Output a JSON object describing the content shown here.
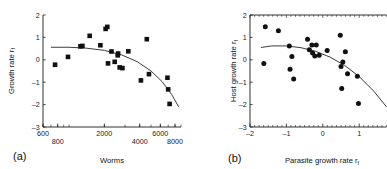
{
  "figure": {
    "background": "#ffffff",
    "ink_color": "#111111",
    "curve_color": "#3c3c3c",
    "marker_color": "#101010"
  },
  "chart_data": [
    {
      "type": "scatter",
      "panel_label": "(a)",
      "title": "",
      "xlabel": "Worms",
      "ylabel": "Growth rate r",
      "ylabel_subscript": "f",
      "xscale": "log",
      "xlim": [
        600,
        9000
      ],
      "ylim": [
        -3,
        2
      ],
      "xticks": [
        600,
        800,
        2000,
        4000,
        6000,
        8000
      ],
      "xtick_labels": [
        "600",
        "800",
        "2000",
        "4000",
        "6000",
        "8000"
      ],
      "xtick_rows": [
        0,
        1,
        0,
        1,
        0,
        1
      ],
      "yticks": [
        -3,
        -2,
        -1,
        0,
        1,
        2
      ],
      "ytick_labels": [
        "-3",
        "-2",
        "-1",
        "0",
        "1",
        "2"
      ],
      "grid": false,
      "legend": "none",
      "marker": "square",
      "points": [
        {
          "x": 760,
          "y": -0.22
        },
        {
          "x": 980,
          "y": 0.13
        },
        {
          "x": 1250,
          "y": 0.6
        },
        {
          "x": 1300,
          "y": 0.62
        },
        {
          "x": 1500,
          "y": 1.07
        },
        {
          "x": 1850,
          "y": 0.65
        },
        {
          "x": 2050,
          "y": 1.38
        },
        {
          "x": 2120,
          "y": 1.47
        },
        {
          "x": 2150,
          "y": -0.16
        },
        {
          "x": 2300,
          "y": 0.37
        },
        {
          "x": 2450,
          "y": -0.09
        },
        {
          "x": 2600,
          "y": 0.2
        },
        {
          "x": 2620,
          "y": 0.28
        },
        {
          "x": 2700,
          "y": -0.34
        },
        {
          "x": 2850,
          "y": -0.37
        },
        {
          "x": 3200,
          "y": 0.38
        },
        {
          "x": 4100,
          "y": -0.92
        },
        {
          "x": 4600,
          "y": 0.92
        },
        {
          "x": 4800,
          "y": -0.64
        },
        {
          "x": 6900,
          "y": -0.8
        },
        {
          "x": 7000,
          "y": -1.32
        },
        {
          "x": 7200,
          "y": -1.97
        }
      ],
      "fit_curve": {
        "label": "quadratic fit",
        "x": [
          700,
          1000,
          1400,
          2000,
          2800,
          3800,
          5000,
          6200,
          7500,
          8600
        ],
        "y": [
          0.56,
          0.56,
          0.52,
          0.42,
          0.22,
          -0.08,
          -0.5,
          -0.97,
          -1.55,
          -2.1
        ]
      }
    },
    {
      "type": "scatter",
      "panel_label": "(b)",
      "title": "",
      "xlabel": "Parasite growth rate r",
      "xlabel_subscript": "f",
      "ylabel": "Host growth rate r",
      "ylabel_subscript": "f",
      "xscale": "linear",
      "xlim": [
        -2,
        1.75
      ],
      "ylim": [
        -3,
        2
      ],
      "xticks": [
        -2,
        -1,
        0,
        1
      ],
      "xtick_labels": [
        "-2",
        "-1",
        "0",
        "1"
      ],
      "yticks": [
        -3,
        -2,
        -1,
        0,
        1,
        2
      ],
      "ytick_labels": [
        "-3",
        "-2",
        "-1",
        "0",
        "1",
        "2"
      ],
      "grid": false,
      "legend": "none",
      "marker": "circle",
      "points": [
        {
          "x": -1.62,
          "y": -0.17
        },
        {
          "x": -1.58,
          "y": 1.47
        },
        {
          "x": -1.22,
          "y": 1.3
        },
        {
          "x": -0.92,
          "y": 0.62
        },
        {
          "x": -0.9,
          "y": -0.42
        },
        {
          "x": -0.85,
          "y": 0.15
        },
        {
          "x": -0.8,
          "y": -0.86
        },
        {
          "x": -0.42,
          "y": 0.92
        },
        {
          "x": -0.37,
          "y": 0.45
        },
        {
          "x": -0.3,
          "y": 0.66
        },
        {
          "x": -0.28,
          "y": 0.3
        },
        {
          "x": -0.22,
          "y": 0.17
        },
        {
          "x": -0.18,
          "y": 0.66
        },
        {
          "x": -0.1,
          "y": 0.2
        },
        {
          "x": 0.12,
          "y": 0.42
        },
        {
          "x": 0.48,
          "y": 1.1
        },
        {
          "x": 0.5,
          "y": -0.3
        },
        {
          "x": 0.52,
          "y": -1.28
        },
        {
          "x": 0.55,
          "y": -0.1
        },
        {
          "x": 0.62,
          "y": 0.36
        },
        {
          "x": 0.68,
          "y": -0.62
        },
        {
          "x": 0.95,
          "y": -0.73
        },
        {
          "x": 0.98,
          "y": -1.95
        }
      ],
      "fit_curve": {
        "label": "quadratic fit",
        "x": [
          -1.7,
          -1.4,
          -1.0,
          -0.6,
          -0.2,
          0.2,
          0.6,
          1.0,
          1.4,
          1.75
        ],
        "y": [
          0.55,
          0.62,
          0.62,
          0.54,
          0.38,
          0.12,
          -0.25,
          -0.75,
          -1.4,
          -2.1
        ]
      }
    }
  ]
}
